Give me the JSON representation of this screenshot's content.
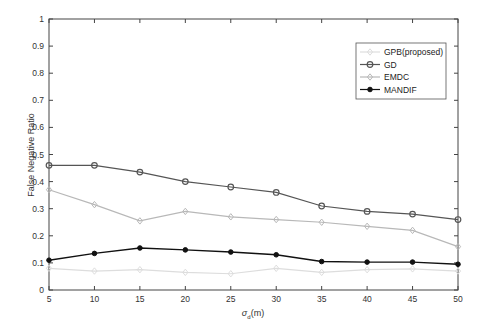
{
  "chart_data": {
    "type": "line",
    "title": "",
    "xlabel": "σ_d(m)",
    "xlabel_main": "σ",
    "xlabel_sub": "d",
    "xlabel_unit": "(m)",
    "ylabel": "False Negative Ratio",
    "x": [
      5,
      10,
      15,
      20,
      25,
      30,
      35,
      40,
      45,
      50
    ],
    "xlim": [
      5,
      50
    ],
    "ylim": [
      0,
      1
    ],
    "xticks": [
      "5",
      "10",
      "15",
      "20",
      "25",
      "30",
      "35",
      "40",
      "45",
      "50"
    ],
    "yticks": [
      "0",
      "0.1",
      "0.2",
      "0.3",
      "0.4",
      "0.5",
      "0.6",
      "0.7",
      "0.8",
      "0.9",
      "1"
    ],
    "grid": false,
    "legend_position": "upper right",
    "series": [
      {
        "name": "GPB(proposed)",
        "color": "#dddddd",
        "marker": "diamond",
        "values": [
          0.08,
          0.07,
          0.075,
          0.065,
          0.06,
          0.08,
          0.065,
          0.075,
          0.078,
          0.07
        ]
      },
      {
        "name": "GD",
        "color": "#555555",
        "marker": "circle",
        "values": [
          0.46,
          0.46,
          0.435,
          0.4,
          0.38,
          0.36,
          0.31,
          0.29,
          0.28,
          0.26
        ]
      },
      {
        "name": "EMDC",
        "color": "#b8b8b8",
        "marker": "diamond",
        "values": [
          0.37,
          0.315,
          0.255,
          0.29,
          0.27,
          0.26,
          0.25,
          0.235,
          0.22,
          0.16
        ]
      },
      {
        "name": "MANDIF",
        "color": "#111111",
        "marker": "filled-circle",
        "values": [
          0.11,
          0.135,
          0.155,
          0.148,
          0.14,
          0.13,
          0.105,
          0.103,
          0.103,
          0.095
        ]
      }
    ]
  }
}
